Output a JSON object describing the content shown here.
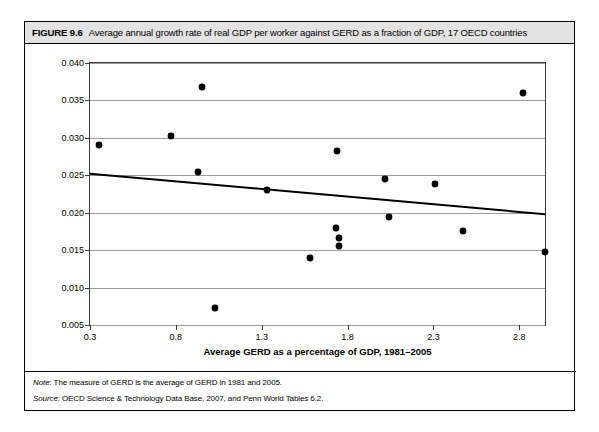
{
  "figure": {
    "number": "FIGURE 9.6",
    "title": "Average annual growth rate of real GDP per worker against GERD as a fraction of GDP, 17 OECD countries",
    "note_lead": "Note",
    "note_text": ": The measure of GERD is the average of GERD in 1981 and 2005.",
    "source_lead": "Source",
    "source_text": ": OECD Science & Technology Data Base, 2007, and Penn World Tables 6.2."
  },
  "chart_data": {
    "type": "scatter",
    "title": "Average annual growth rate of real GDP per worker against GERD as a fraction of GDP, 17 OECD countries",
    "xlabel": "Average GERD as a percentage of GDP, 1981–2005",
    "ylabel": "Average annual growth rate of GDP per worker, 1960–2003",
    "xlim": [
      0.3,
      2.95
    ],
    "ylim": [
      0.005,
      0.04
    ],
    "xticks": [
      0.3,
      0.8,
      1.3,
      1.8,
      2.3,
      2.8
    ],
    "xtick_labels": [
      "0.3",
      "0.8",
      "1.3",
      "1.8",
      "2.3",
      "2.8"
    ],
    "yticks": [
      0.005,
      0.01,
      0.015,
      0.02,
      0.025,
      0.03,
      0.035,
      0.04
    ],
    "ytick_labels": [
      "0.005",
      "0.010",
      "0.015",
      "0.020",
      "0.025",
      "0.030",
      "0.035",
      "0.040"
    ],
    "grid": "horizontal",
    "legend": "none",
    "marker": "diamond",
    "marker_color": "#000000",
    "points": [
      {
        "x": 0.35,
        "y": 0.029
      },
      {
        "x": 0.77,
        "y": 0.0302
      },
      {
        "x": 0.95,
        "y": 0.0368
      },
      {
        "x": 0.93,
        "y": 0.0255
      },
      {
        "x": 1.03,
        "y": 0.0073
      },
      {
        "x": 1.33,
        "y": 0.0231
      },
      {
        "x": 1.58,
        "y": 0.0139
      },
      {
        "x": 1.74,
        "y": 0.0282
      },
      {
        "x": 1.73,
        "y": 0.018
      },
      {
        "x": 1.75,
        "y": 0.0166
      },
      {
        "x": 1.75,
        "y": 0.0156
      },
      {
        "x": 2.02,
        "y": 0.0245
      },
      {
        "x": 2.04,
        "y": 0.0194
      },
      {
        "x": 2.31,
        "y": 0.0239
      },
      {
        "x": 2.47,
        "y": 0.0175
      },
      {
        "x": 2.82,
        "y": 0.036
      },
      {
        "x": 2.95,
        "y": 0.0147
      }
    ],
    "trendline": {
      "type": "line",
      "color": "#000000",
      "x": [
        0.3,
        2.95
      ],
      "y": [
        0.0252,
        0.0198
      ]
    }
  }
}
